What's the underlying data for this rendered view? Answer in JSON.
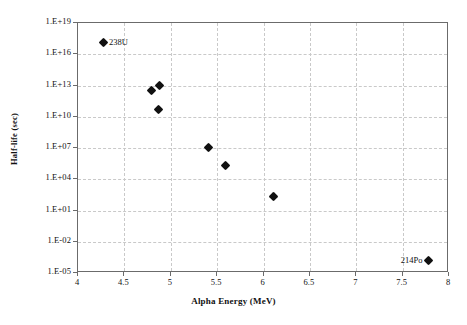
{
  "chart_data": {
    "type": "scatter",
    "title": "",
    "xlabel": "Alpha Energy (MeV)",
    "ylabel": "Half-life (sec)",
    "xlim": [
      4,
      8
    ],
    "ylim": [
      1e-05,
      1e+19
    ],
    "yscale": "log",
    "xscale": "linear",
    "grid": true,
    "legend": false,
    "xticks": [
      "4",
      "4.5",
      "5",
      "5.5",
      "6",
      "6.5",
      "7",
      "7.5",
      "8"
    ],
    "xtick_values": [
      4,
      4.5,
      5,
      5.5,
      6,
      6.5,
      7,
      7.5,
      8
    ],
    "yticks": [
      "1.E+19",
      "1.E+16",
      "1.E+13",
      "1.E+10",
      "1.E+07",
      "1.E+04",
      "1.E+01",
      "1.E-02",
      "1.E-05"
    ],
    "ytick_values": [
      1e+19,
      1e+16,
      10000000000000.0,
      10000000000.0,
      10000000.0,
      10000.0,
      10.0,
      0.01,
      1e-05
    ],
    "series": [
      {
        "name": "alpha emitters",
        "marker": "diamond",
        "color": "#111111",
        "points": [
          {
            "x": 4.27,
            "y": 1.4e+17,
            "label": "238U",
            "label_side": "right"
          },
          {
            "x": 4.79,
            "y": 3000000000000.0,
            "label": "",
            "label_side": ""
          },
          {
            "x": 4.88,
            "y": 10000000000000.0,
            "label": "",
            "label_side": ""
          },
          {
            "x": 4.87,
            "y": 55000000000.0,
            "label": "",
            "label_side": ""
          },
          {
            "x": 5.41,
            "y": 12000000.0,
            "label": "",
            "label_side": ""
          },
          {
            "x": 5.59,
            "y": 200000.0,
            "label": "",
            "label_side": ""
          },
          {
            "x": 6.11,
            "y": 220.0,
            "label": "",
            "label_side": ""
          },
          {
            "x": 7.78,
            "y": 0.00016,
            "label": "214Po",
            "label_side": "left"
          }
        ]
      }
    ]
  },
  "colors": {
    "axis": "#6b6b6b",
    "grid": "#c9c9c9",
    "marker": "#111111",
    "text": "#111111",
    "background": "#ffffff"
  }
}
